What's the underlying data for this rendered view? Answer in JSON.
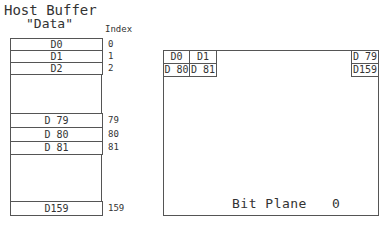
{
  "host_buffer": {
    "title_line1": "Host Buffer",
    "title_line2": "\"Data\"",
    "index_header": "Index",
    "rows": [
      {
        "label": "D0",
        "index": "0"
      },
      {
        "label": "D1",
        "index": "1"
      },
      {
        "label": "D2",
        "index": "2"
      },
      {
        "label": "D 79",
        "index": "79"
      },
      {
        "label": "D 80",
        "index": "80"
      },
      {
        "label": "D 81",
        "index": "81"
      },
      {
        "label": "D159",
        "index": "159"
      }
    ]
  },
  "bit_plane": {
    "label": "Bit Plane   0",
    "cells": {
      "top_left_0": "D0",
      "top_left_1": "D1",
      "bottom_left_0": "D 80",
      "bottom_left_1": "D 81",
      "top_right": "D 79",
      "bottom_right": "D159"
    }
  }
}
